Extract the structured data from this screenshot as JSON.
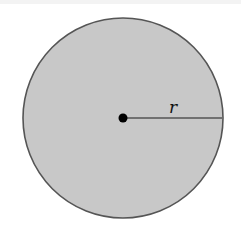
{
  "diagram": {
    "type": "circle-radius",
    "circle": {
      "cx": 123,
      "cy": 118,
      "r": 100,
      "fill": "#c8c8c8",
      "stroke": "#555555"
    },
    "center_point": {
      "cx": 123,
      "cy": 118,
      "r": 4.5,
      "color": "#000000"
    },
    "radius_line": {
      "x1": 123,
      "y1": 118,
      "x2": 222,
      "y2": 118,
      "color": "#555555"
    },
    "label": {
      "text": "r",
      "x": 169,
      "y": 113
    }
  }
}
